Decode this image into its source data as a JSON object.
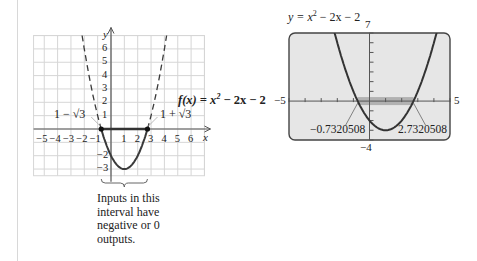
{
  "chart_data": [
    {
      "type": "line",
      "title": "f(x) = x² − 2x − 2",
      "function": "x^2 - 2x - 2",
      "xlabel": "x",
      "ylabel": "y",
      "xlim": [
        -5.8,
        7
      ],
      "ylim": [
        -3.5,
        7
      ],
      "grid": true,
      "x_ticks": [
        "-5",
        "-4",
        "-3",
        "-2",
        "-1",
        "1",
        "2",
        "3",
        "4",
        "5",
        "6"
      ],
      "y_ticks": [
        "1",
        "2",
        "3",
        "4",
        "5",
        "6",
        "-2",
        "-3"
      ],
      "roots": [
        -0.7320508,
        2.7320508
      ],
      "root_labels": [
        "1 − √3",
        "1 + √3"
      ],
      "vertex": [
        1,
        -3
      ],
      "annotation": [
        "Inputs in this",
        "interval have",
        "negative or 0",
        "outputs."
      ],
      "highlight_interval": [
        -0.7320508,
        2.7320508
      ]
    },
    {
      "type": "line",
      "title": "y = x² − 2x − 2",
      "function": "x^2 - 2x - 2",
      "xlim": [
        -5,
        5
      ],
      "ylim": [
        -4,
        7
      ],
      "window_labels": {
        "xmin": "−5",
        "xmax": "5",
        "ymin": "−4",
        "ymax": "7"
      },
      "roots": [
        -0.7320508,
        2.7320508
      ],
      "root_labels": [
        "−0.7320508",
        "2.7320508"
      ],
      "highlight_interval": [
        -0.7320508,
        2.7320508
      ]
    }
  ],
  "left": {
    "y_axis_label": "y",
    "x_axis_label": "x",
    "function_label_prefix": "f(x) = x",
    "function_label_suffix": " − 2x − 2",
    "exp": "2",
    "root_left": "1 − √3",
    "root_right": "1 + √3",
    "x_ticks": [
      "−5",
      "−4",
      "−3",
      "−2",
      "−1",
      "1",
      "2",
      "3",
      "4",
      "5",
      "6"
    ],
    "y_ticks_pos": [
      "1",
      "2",
      "3",
      "4",
      "5",
      "6"
    ],
    "y_ticks_neg": [
      "−2",
      "−3"
    ],
    "caption": [
      "Inputs in this",
      "interval have",
      "negative or 0",
      "outputs."
    ]
  },
  "right": {
    "title_prefix": "y = x",
    "title_suffix": " − 2x − 2",
    "exp": "2",
    "xmin": "−5",
    "xmax": "5",
    "ymin": "−4",
    "ymax": "7",
    "root_left": "−0.7320508",
    "root_right": "2.7320508"
  },
  "colors": {
    "curve": "#3a3a3a",
    "grid": "#d6d6d6",
    "screen_bg": "#e6e6e6",
    "highlight": "#9a9a9a"
  }
}
